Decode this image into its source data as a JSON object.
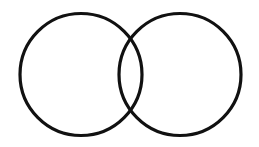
{
  "figure": {
    "background_color": "#ffffff",
    "width": 259,
    "height": 147
  },
  "chart_data": {
    "type": "diagram",
    "subtype": "venn-two-set",
    "title": "",
    "xlabel": "",
    "ylabel": "",
    "grid": false,
    "legend": false,
    "annotations": [],
    "style": {
      "stroke_color": "#111111",
      "stroke_width": 3.2,
      "fill": "none",
      "background": "#ffffff"
    },
    "shapes": [
      {
        "name": "left-circle",
        "type": "circle",
        "cx": 81,
        "cy": 74.5,
        "r": 61,
        "fill": "none",
        "stroke": "#111111",
        "stroke_width": 3.2,
        "label": ""
      },
      {
        "name": "right-circle",
        "type": "circle",
        "cx": 180,
        "cy": 74.5,
        "r": 61,
        "fill": "none",
        "stroke": "#111111",
        "stroke_width": 3.2,
        "label": ""
      }
    ],
    "geometry": {
      "center_distance": 99,
      "radius": 61,
      "overlap_width": 23,
      "intersection_points": [
        {
          "x": 130.5,
          "y": 39.0
        },
        {
          "x": 130.5,
          "y": 110.0
        }
      ],
      "left_extent_x": 20,
      "right_extent_x": 241,
      "top_extent_y": 13.5,
      "bottom_extent_y": 135.5
    }
  }
}
